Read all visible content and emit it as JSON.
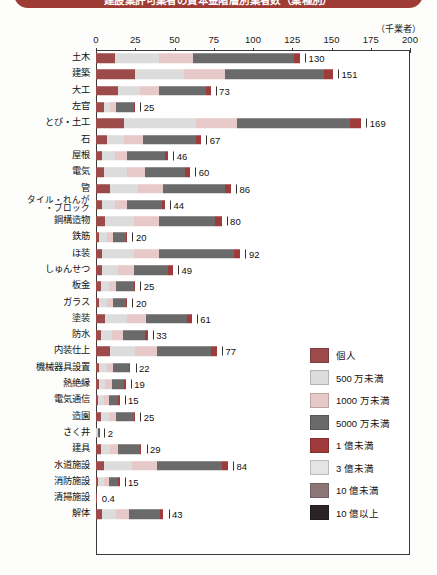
{
  "title": "建設業許可業者の資本金階層別業者数（業種別）",
  "axis": {
    "unit_label": "（千業者）",
    "ticks": [
      0,
      25,
      50,
      75,
      100,
      125,
      150,
      175,
      200
    ],
    "min": 0,
    "max": 200
  },
  "legend": {
    "items": [
      {
        "label": "個人",
        "color": "#9d4a4a"
      },
      {
        "label": "500 万未満",
        "color": "#dcdcdc"
      },
      {
        "label": "1000 万未満",
        "color": "#e7c9c9"
      },
      {
        "label": "5000 万未満",
        "color": "#6a6a6a"
      },
      {
        "label": "1 億未満",
        "color": "#a03b3b"
      },
      {
        "label": "3 億未満",
        "color": "#e4e4e4"
      },
      {
        "label": "10 億未満",
        "color": "#8c7676"
      },
      {
        "label": "10 億以上",
        "color": "#2b2424"
      }
    ]
  },
  "chart_data": {
    "type": "bar",
    "orientation": "horizontal",
    "stacked": true,
    "title": "建設業許可業者の資本金階層別業者数（業種別）",
    "xlabel": "（千業者）",
    "ylabel": "",
    "xlim": [
      0,
      200
    ],
    "grid": false,
    "legend_position": "right-bottom",
    "series": [
      {
        "name": "個人",
        "color": "#9d4a4a"
      },
      {
        "name": "500 万未満",
        "color": "#dcdcdc"
      },
      {
        "name": "1000 万未満",
        "color": "#e7c9c9"
      },
      {
        "name": "5000 万未満",
        "color": "#6a6a6a"
      },
      {
        "name": "1 億未満",
        "color": "#a03b3b"
      },
      {
        "name": "3 億未満",
        "color": "#e4e4e4"
      },
      {
        "name": "10 億未満",
        "color": "#8c7676"
      },
      {
        "name": "10 億以上",
        "color": "#2b2424"
      }
    ],
    "categories": [
      "土木",
      "建築",
      "大工",
      "左官",
      "とび・土工",
      "石",
      "屋根",
      "電気",
      "管",
      "タイル・れんが・ブロック",
      "鋼構造物",
      "鉄筋",
      "ほ装",
      "しゅんせつ",
      "板金",
      "ガラス",
      "塗装",
      "防水",
      "内装仕上",
      "機械器具設置",
      "熱絶縁",
      "電気通信",
      "造園",
      "さく井",
      "建具",
      "水道施設",
      "消防施設",
      "清掃施設",
      "解体"
    ],
    "totals": [
      130,
      151,
      73,
      25,
      169,
      67,
      46,
      60,
      86,
      44,
      80,
      20,
      92,
      49,
      25,
      20,
      61,
      33,
      77,
      22,
      19,
      15,
      25,
      2,
      29,
      84,
      15,
      0.4,
      43
    ],
    "rows": [
      {
        "category": "土木",
        "total": 130,
        "label": "130",
        "two_line": false,
        "segments": [
          12,
          28,
          22,
          64,
          4,
          0,
          0,
          0
        ]
      },
      {
        "category": "建築",
        "total": 151,
        "label": "151",
        "two_line": false,
        "segments": [
          25,
          31,
          26,
          63,
          6,
          0,
          0,
          0
        ]
      },
      {
        "category": "大工",
        "total": 73,
        "label": "73",
        "two_line": false,
        "segments": [
          14,
          14,
          12,
          30,
          3,
          0,
          0,
          0
        ]
      },
      {
        "category": "左官",
        "total": 25,
        "label": "25",
        "two_line": false,
        "segments": [
          5,
          4,
          4,
          11,
          1,
          0,
          0,
          0
        ]
      },
      {
        "category": "とび・土工",
        "total": 169,
        "label": "169",
        "two_line": false,
        "segments": [
          18,
          46,
          26,
          72,
          7,
          0,
          0,
          0
        ]
      },
      {
        "category": "石",
        "total": 67,
        "label": "67",
        "two_line": false,
        "segments": [
          7,
          11,
          12,
          34,
          3,
          0,
          0,
          0
        ]
      },
      {
        "category": "屋根",
        "total": 46,
        "label": "46",
        "two_line": false,
        "segments": [
          4,
          8,
          8,
          24,
          2,
          0,
          0,
          0
        ]
      },
      {
        "category": "電気",
        "total": 60,
        "label": "60",
        "two_line": false,
        "segments": [
          5,
          15,
          11,
          26,
          3,
          0,
          0,
          0
        ]
      },
      {
        "category": "管",
        "total": 86,
        "label": "86",
        "two_line": false,
        "segments": [
          9,
          18,
          16,
          39,
          4,
          0,
          0,
          0
        ]
      },
      {
        "category": "タイル・れんが・ブロック",
        "total": 44,
        "label": "44",
        "two_line": true,
        "segments": [
          4,
          8,
          8,
          22,
          2,
          0,
          0,
          0
        ]
      },
      {
        "category": "鋼構造物",
        "total": 80,
        "label": "80",
        "two_line": false,
        "segments": [
          6,
          18,
          16,
          36,
          4,
          0,
          0,
          0
        ]
      },
      {
        "category": "鉄筋",
        "total": 20,
        "label": "20",
        "two_line": false,
        "segments": [
          2,
          5,
          4,
          8,
          1,
          0,
          0,
          0
        ]
      },
      {
        "category": "ほ装",
        "total": 92,
        "label": "92",
        "two_line": false,
        "segments": [
          4,
          20,
          16,
          48,
          4,
          0,
          0,
          0
        ]
      },
      {
        "category": "しゅんせつ",
        "total": 49,
        "label": "49",
        "two_line": false,
        "segments": [
          4,
          10,
          10,
          22,
          3,
          0,
          0,
          0
        ]
      },
      {
        "category": "板金",
        "total": 25,
        "label": "25",
        "two_line": false,
        "segments": [
          3,
          5,
          5,
          11,
          1,
          0,
          0,
          0
        ]
      },
      {
        "category": "ガラス",
        "total": 20,
        "label": "20",
        "two_line": false,
        "segments": [
          2,
          5,
          4,
          8,
          1,
          0,
          0,
          0
        ]
      },
      {
        "category": "塗装",
        "total": 61,
        "label": "61",
        "two_line": false,
        "segments": [
          6,
          14,
          12,
          26,
          3,
          0,
          0,
          0
        ]
      },
      {
        "category": "防水",
        "total": 33,
        "label": "33",
        "two_line": false,
        "segments": [
          3,
          7,
          7,
          14,
          2,
          0,
          0,
          0
        ]
      },
      {
        "category": "内装仕上",
        "total": 77,
        "label": "77",
        "two_line": false,
        "segments": [
          9,
          16,
          14,
          34,
          4,
          0,
          0,
          0
        ]
      },
      {
        "category": "機械器具設置",
        "total": 22,
        "label": "22",
        "two_line": false,
        "segments": [
          2,
          5,
          4,
          10,
          1,
          0,
          0,
          0
        ]
      },
      {
        "category": "熱絶縁",
        "total": 19,
        "label": "19",
        "two_line": false,
        "segments": [
          2,
          4,
          4,
          8,
          1,
          0,
          0,
          0
        ]
      },
      {
        "category": "電気通信",
        "total": 15,
        "label": "15",
        "two_line": false,
        "segments": [
          1,
          4,
          3,
          6,
          1,
          0,
          0,
          0
        ]
      },
      {
        "category": "造園",
        "total": 25,
        "label": "25",
        "two_line": false,
        "segments": [
          3,
          5,
          5,
          11,
          1,
          0,
          0,
          0
        ]
      },
      {
        "category": "さく井",
        "total": 2,
        "label": "2",
        "two_line": false,
        "segments": [
          0.3,
          0.4,
          0.4,
          0.8,
          0.1,
          0,
          0,
          0
        ]
      },
      {
        "category": "建具",
        "total": 29,
        "label": "29",
        "two_line": false,
        "segments": [
          3,
          6,
          5,
          14,
          1,
          0,
          0,
          0
        ]
      },
      {
        "category": "水道施設",
        "total": 84,
        "label": "84",
        "two_line": false,
        "segments": [
          5,
          18,
          16,
          41,
          4,
          0,
          0,
          0
        ]
      },
      {
        "category": "消防施設",
        "total": 15,
        "label": "15",
        "two_line": false,
        "segments": [
          1,
          4,
          3,
          6,
          1,
          0,
          0,
          0
        ]
      },
      {
        "category": "清掃施設",
        "total": 0.4,
        "label": "0.4",
        "two_line": false,
        "segments": [
          0,
          0,
          0,
          0,
          0,
          0,
          0,
          0
        ]
      },
      {
        "category": "解体",
        "total": 43,
        "label": "43",
        "two_line": false,
        "segments": [
          4,
          9,
          8,
          20,
          2,
          0,
          0,
          0
        ]
      }
    ]
  }
}
